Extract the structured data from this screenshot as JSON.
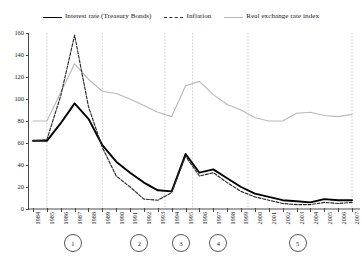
{
  "chart_data": {
    "type": "line",
    "title": "",
    "xlabel": "",
    "ylabel": "",
    "ylim": [
      0,
      160
    ],
    "ytick_step": 20,
    "yticks": [
      0,
      20,
      40,
      60,
      80,
      100,
      120,
      140,
      160
    ],
    "grid": false,
    "legend_position": "top-center",
    "x": [
      1984,
      1985,
      1986,
      1987,
      1988,
      1989,
      1990,
      1991,
      1992,
      1993,
      1994,
      1995,
      1996,
      1997,
      1998,
      1999,
      2000,
      2001,
      2002,
      2003,
      2004,
      2005,
      2006,
      2007
    ],
    "xtick_labels": [
      "1984",
      "1985",
      "1986",
      "1987",
      "1988",
      "1989",
      "1990",
      "1991",
      "1992",
      "1993",
      "1994",
      "1995",
      "1996",
      "1997",
      "1998",
      "1999",
      "2000",
      "2001",
      "2002",
      "2003",
      "2004",
      "2005",
      "2006",
      "2007"
    ],
    "series": [
      {
        "name": "Interest rate (Treasury Bonds)",
        "style": "solid",
        "color": "#000000",
        "width": 1.9,
        "values": [
          62,
          62,
          78,
          96,
          82,
          58,
          43,
          33,
          24,
          17,
          16,
          50,
          33,
          36,
          28,
          20,
          14,
          11,
          8,
          7,
          6,
          9,
          8,
          8
        ]
      },
      {
        "name": "Inflation",
        "style": "dashed",
        "color": "#2b2b2b",
        "width": 1.15,
        "values": [
          62,
          63,
          103,
          158,
          93,
          56,
          30,
          20,
          9,
          8,
          15,
          48,
          30,
          33,
          24,
          16,
          11,
          8,
          5,
          4,
          4,
          6,
          5,
          6
        ]
      },
      {
        "name": "Real exchange rate index",
        "style": "solid",
        "color": "#b9b9b9",
        "width": 1.15,
        "values": [
          80,
          80,
          106,
          132,
          118,
          107,
          105,
          100,
          94,
          88,
          84,
          112,
          116,
          104,
          95,
          90,
          83,
          80,
          80,
          87,
          88,
          85,
          84,
          86
        ]
      }
    ],
    "separators": [
      1985,
      1989,
      1993.5,
      1995.5,
      1999.5,
      2007
    ],
    "annotations": {
      "phase_circles": [
        {
          "label": "1",
          "x": 1986.8
        },
        {
          "label": "2",
          "x": 1991.6
        },
        {
          "label": "3",
          "x": 1994.6
        },
        {
          "label": "4",
          "x": 1997.3
        },
        {
          "label": "5",
          "x": 2003.0
        }
      ]
    }
  },
  "legend": {
    "items": [
      {
        "label": "Interest rate (Treasury Bonds)",
        "key": "solid-black-line-swatch"
      },
      {
        "label": "Inflation",
        "key": "dashed-black-line-swatch"
      },
      {
        "label": "Real exchange rate index",
        "key": "solid-gray-line-swatch"
      }
    ]
  }
}
